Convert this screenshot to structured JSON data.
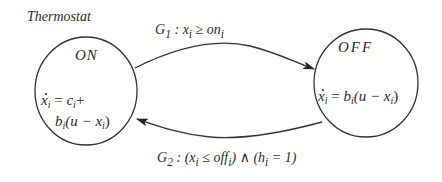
{
  "diagram": {
    "title": "Thermostat",
    "states": [
      {
        "id": "on",
        "name": "ON",
        "dynamics_line1": {
          "var": "x",
          "sub": "i",
          "eq": " = ",
          "rhs": "c",
          "rhs_sub": "i",
          "tail": "+"
        },
        "dynamics_line2": {
          "coef": "b",
          "coef_sub": "i",
          "open": "(u − ",
          "var": "x",
          "var_sub": "i",
          "close": ")"
        }
      },
      {
        "id": "off",
        "name": "OFF",
        "dynamics": {
          "var": "x",
          "sub": "i",
          "eq": " = ",
          "coef": "b",
          "coef_sub": "i",
          "open": "(u − ",
          "var2": "x",
          "var2_sub": "i",
          "close": ")"
        }
      }
    ],
    "transitions": [
      {
        "id": "g1",
        "from": "ON",
        "to": "OFF",
        "guard_name": "G",
        "guard_sub": "1",
        "sep": " : ",
        "lhs": "x",
        "lhs_sub": "i",
        "op": " ≥ ",
        "rhs": "on",
        "rhs_sub": "i"
      },
      {
        "id": "g2",
        "from": "OFF",
        "to": "ON",
        "guard_name": "G",
        "guard_sub": "2",
        "sep": " : ",
        "p1_open": "(",
        "lhs": "x",
        "lhs_sub": "i",
        "op": " ≤ ",
        "rhs": "off",
        "rhs_sub": "i",
        "p1_close": ")",
        "and": " ∧ ",
        "p2_open": "(",
        "h": "h",
        "h_sub": "i",
        "h_eq": " = 1",
        "p2_close": ")"
      }
    ]
  }
}
